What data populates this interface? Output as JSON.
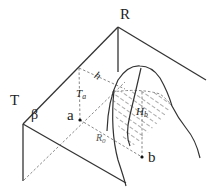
{
  "diagram": {
    "labels": {
      "R": "R",
      "T": "T",
      "beta": "β",
      "a": "a",
      "b": "b",
      "h": "h",
      "Ta_main": "T",
      "Ta_sub": "a",
      "Hb_main": "H",
      "Hb_sub": "b",
      "R0_main": "R",
      "R0_sub": "0"
    },
    "colors": {
      "solid": "#333333",
      "dashed": "#888888",
      "hatch": "#555555"
    }
  }
}
